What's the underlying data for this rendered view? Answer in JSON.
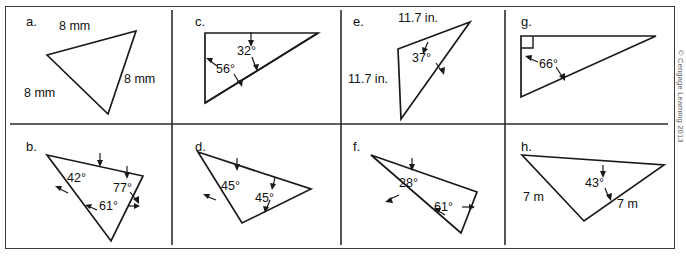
{
  "figure": {
    "copyright": "© Cengage Learning 2013",
    "panels": [
      {
        "id": "a",
        "label": "a.",
        "kind": "triangle-with-side-lengths",
        "side_labels": [
          "8 mm",
          "8 mm",
          "8 mm"
        ],
        "angle_labels": [],
        "vertices": [
          [
            47,
            55
          ],
          [
            136,
            31
          ],
          [
            108,
            114
          ]
        ]
      },
      {
        "id": "c",
        "label": "c.",
        "kind": "triangle-with-angles",
        "side_labels": [],
        "angle_labels": [
          "32°",
          "56°"
        ],
        "vertices": [
          [
            205,
            33
          ],
          [
            318,
            33
          ],
          [
            205,
            103
          ]
        ]
      },
      {
        "id": "e",
        "label": "e.",
        "kind": "triangle-with-side-lengths",
        "side_labels": [
          "11.7 in.",
          "11.7 in."
        ],
        "angle_labels": [
          "37°"
        ],
        "vertices": [
          [
            398,
            49
          ],
          [
            470,
            22
          ],
          [
            401,
            119
          ]
        ]
      },
      {
        "id": "g",
        "label": "g.",
        "kind": "right-triangle-with-angle",
        "side_labels": [],
        "angle_labels": [
          "66°"
        ],
        "right_angle": true,
        "vertices": [
          [
            521,
            36
          ],
          [
            656,
            36
          ],
          [
            521,
            97
          ]
        ]
      },
      {
        "id": "b",
        "label": "b.",
        "kind": "triangle-with-angles",
        "side_labels": [],
        "angle_labels": [
          "42°",
          "77°",
          "61°"
        ],
        "vertices": [
          [
            47,
            155
          ],
          [
            143,
            176
          ],
          [
            111,
            241
          ]
        ]
      },
      {
        "id": "d",
        "label": "d.",
        "kind": "triangle-with-angles",
        "side_labels": [],
        "angle_labels": [
          "45°",
          "45°"
        ],
        "vertices": [
          [
            198,
            152
          ],
          [
            311,
            189
          ],
          [
            242,
            223
          ]
        ]
      },
      {
        "id": "f",
        "label": "f.",
        "kind": "triangle-with-angles",
        "side_labels": [],
        "angle_labels": [
          "28°",
          "61°"
        ],
        "vertices": [
          [
            371,
            155
          ],
          [
            477,
            192
          ],
          [
            461,
            233
          ]
        ]
      },
      {
        "id": "h",
        "label": "h.",
        "kind": "triangle-with-side-lengths",
        "side_labels": [
          "7 m",
          "7 m"
        ],
        "angle_labels": [
          "43°"
        ],
        "vertices": [
          [
            522,
            155
          ],
          [
            664,
            165
          ],
          [
            584,
            221
          ]
        ]
      }
    ]
  },
  "labels": {
    "panel_a": "a.",
    "panel_b": "b.",
    "panel_c": "c.",
    "panel_d": "d.",
    "panel_e": "e.",
    "panel_f": "f.",
    "panel_g": "g.",
    "panel_h": "h.",
    "a_side1": "8 mm",
    "a_side2": "8 mm",
    "a_side3": "8 mm",
    "c_angle1": "32°",
    "c_angle2": "56°",
    "e_side1": "11.7 in.",
    "e_side2": "11.7 in.",
    "e_angle1": "37°",
    "g_angle1": "66°",
    "b_angle1": "42°",
    "b_angle2": "77°",
    "b_angle3": "61°",
    "d_angle1": "45°",
    "d_angle2": "45°",
    "f_angle1": "28°",
    "f_angle2": "61°",
    "h_side1": "7 m",
    "h_side2": "7 m",
    "h_angle1": "43°",
    "copyright": "© Cengage Learning 2013"
  },
  "colors": {
    "stroke": "#1a1a1a",
    "frame": "#3b3b3b",
    "background": "#ffffff",
    "copyright_text": "#5a5a5a"
  }
}
